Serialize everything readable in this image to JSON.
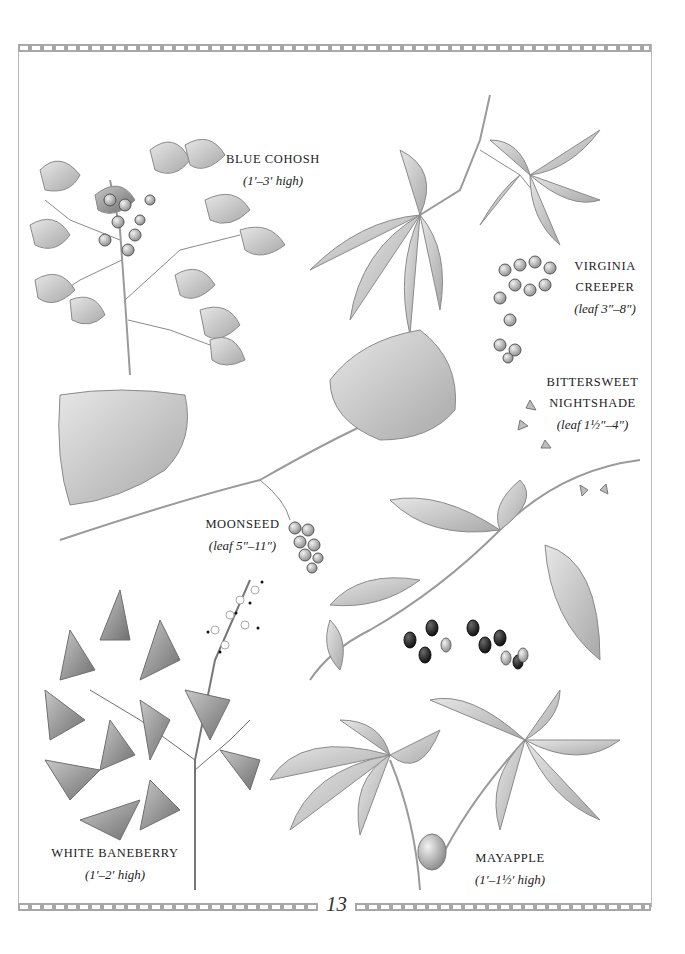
{
  "page": {
    "number": "13"
  },
  "plants": [
    {
      "id": "blue-cohosh",
      "name": "BLUE COHOSH",
      "size": "(1′–3′ high)"
    },
    {
      "id": "virginia-creeper",
      "name_lines": [
        "VIRGINIA",
        "CREEPER"
      ],
      "size": "(leaf 3″–8″)"
    },
    {
      "id": "bittersweet-nightshade",
      "name_lines": [
        "BITTERSWEET",
        "NIGHTSHADE"
      ],
      "size": "(leaf 1½″–4″)"
    },
    {
      "id": "moonseed",
      "name": "MOONSEED",
      "size": "(leaf 5″–11″)"
    },
    {
      "id": "white-baneberry",
      "name": "WHITE BANEBERRY",
      "size": "(1′–2′ high)"
    },
    {
      "id": "mayapple",
      "name": "MAYAPPLE",
      "size": "(1′–1½′ high)"
    }
  ],
  "colors": {
    "border": "#a7a7a7",
    "ink": "#222222",
    "leaf_fill": "#cfcfcf",
    "leaf_stroke": "#8a8a8a",
    "berry_dark": "#1e1e1e",
    "berry_light": "#9a9a9a"
  }
}
